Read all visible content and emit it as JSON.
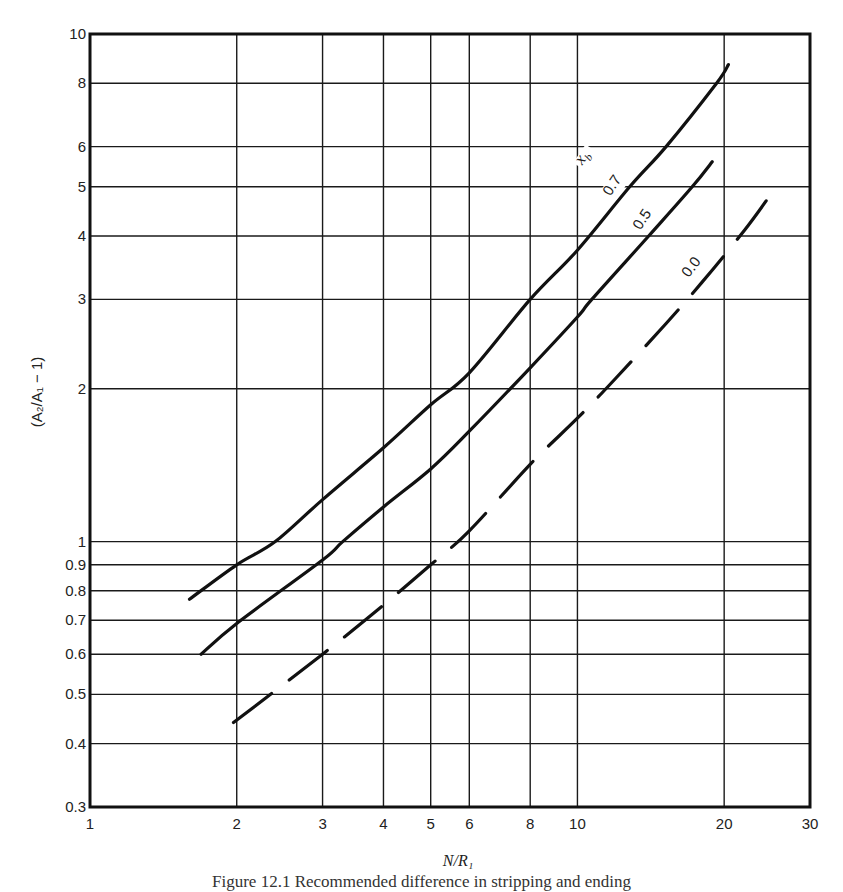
{
  "chart_data": {
    "type": "line",
    "title": "",
    "xlabel": "N/R₁",
    "ylabel": "(A₂/A₁ − 1)",
    "xscale": "log",
    "yscale": "log",
    "xlim": [
      1,
      30
    ],
    "ylim": [
      0.3,
      10
    ],
    "grid": true,
    "x_ticks": [
      1,
      2,
      3,
      4,
      5,
      6,
      8,
      10,
      20,
      30
    ],
    "x_tick_labels": [
      "1",
      "2",
      "3",
      "4",
      "5",
      "6",
      "8",
      "10",
      "20",
      "30"
    ],
    "y_ticks": [
      0.3,
      0.4,
      0.5,
      0.6,
      0.7,
      0.8,
      0.9,
      1,
      2,
      3,
      4,
      5,
      6,
      8,
      10
    ],
    "y_tick_labels": [
      "0.3",
      "0.4",
      "0.5",
      "0.6",
      "0.7",
      "0.8",
      "0.9",
      "1",
      "2",
      "3",
      "4",
      "5",
      "6",
      "8",
      "10"
    ],
    "legend_title": "x_b",
    "legend_placement": "inline-top-right",
    "series": [
      {
        "name": "0.7",
        "style": "solid",
        "x": [
          1.6,
          2,
          2.4,
          3,
          4,
          5,
          6,
          8,
          10,
          12.8,
          15.2,
          19.3,
          20.4
        ],
        "y": [
          0.77,
          0.9,
          1.0,
          1.21,
          1.53,
          1.86,
          2.15,
          3.0,
          3.75,
          5.0,
          6.0,
          8.0,
          8.7
        ]
      },
      {
        "name": "0.5",
        "style": "solid",
        "x": [
          1.69,
          2,
          3,
          3.3,
          4,
          5,
          6,
          8,
          10,
          10.7,
          14,
          17.2,
          18.9
        ],
        "y": [
          0.6,
          0.69,
          0.92,
          1.0,
          1.17,
          1.39,
          1.65,
          2.2,
          2.77,
          3.0,
          4.0,
          5.0,
          5.6
        ]
      },
      {
        "name": "0.0",
        "style": "dashed",
        "x": [
          1.97,
          3,
          4,
          5,
          6,
          8,
          10,
          12,
          15.2,
          18,
          22,
          24.7
        ],
        "y": [
          0.44,
          0.6,
          0.75,
          0.9,
          1.05,
          1.42,
          1.75,
          2.1,
          2.69,
          3.24,
          4.1,
          4.77
        ]
      }
    ]
  },
  "caption": "Figure 12.1  Recommended difference in stripping and ending"
}
